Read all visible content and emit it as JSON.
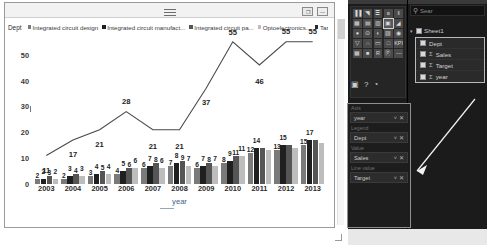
{
  "window": {
    "grip_icon": "window-grip",
    "restore_label": "❐",
    "minimize_label": "—"
  },
  "legend": {
    "title": "Dept",
    "items": [
      {
        "label": "Integrated circuit design",
        "color": "#7a7a7a"
      },
      {
        "label": "Integrated circuit manufact...",
        "color": "#1f1f1f"
      },
      {
        "label": "Integrated circuit pa...",
        "color": "#555555"
      },
      {
        "label": "Optoelectronics...",
        "color": "#bdbdbd"
      },
      {
        "label": "Target",
        "color": "#2b2b2b"
      }
    ]
  },
  "chart_data": {
    "type": "bar",
    "title": "",
    "xlabel": "year",
    "ylabel": "",
    "ylim": [
      0,
      55
    ],
    "yticks": [
      "0",
      "10",
      "20",
      "30",
      "40",
      "50"
    ],
    "grid": false,
    "legend_position": "top",
    "categories": [
      "2003",
      "2004",
      "2005",
      "2006",
      "2007",
      "2008",
      "2009",
      "2010",
      "2011",
      "2012",
      "2013"
    ],
    "series": [
      {
        "name": "Integrated circuit design",
        "type": "bar",
        "color": "#7a7a7a",
        "values": [
          2,
          2,
          3,
          4,
          6,
          7,
          6,
          8,
          12,
          13,
          15
        ],
        "labels": [
          "2",
          "2",
          "3",
          "4",
          "6",
          "7",
          "6",
          "8",
          "12",
          "13",
          "15"
        ]
      },
      {
        "name": "Integrated circuit manufact...",
        "type": "bar",
        "color": "#1f1f1f",
        "values": [
          2,
          3,
          4,
          5,
          7,
          8,
          7,
          9,
          14,
          15,
          17
        ],
        "labels": [
          "2",
          "3",
          "4",
          "5",
          "7",
          "8",
          "7",
          "9",
          "14",
          "15",
          "17"
        ]
      },
      {
        "name": "Integrated circuit pa...",
        "type": "bar",
        "color": "#555555",
        "values": [
          3,
          4,
          5,
          6,
          8,
          9,
          8,
          11,
          14,
          15,
          17
        ],
        "labels": [
          "3",
          "4",
          "5",
          "6",
          "8",
          "9",
          "8",
          "11",
          "",
          "",
          ""
        ]
      },
      {
        "name": "Optoelectronics...",
        "type": "bar",
        "color": "#bdbdbd",
        "values": [
          2,
          3,
          4,
          6,
          6,
          7,
          7,
          11,
          13,
          14,
          16
        ],
        "labels": [
          "2",
          "3",
          "4",
          "6",
          "6",
          "7",
          "7",
          "11",
          "",
          "",
          ""
        ]
      },
      {
        "name": "Target",
        "type": "line",
        "color": "#4a4a4a",
        "values": [
          11,
          17,
          21,
          28,
          21,
          21,
          37,
          55,
          46,
          55,
          55
        ],
        "labels": [
          "11",
          "17",
          "21",
          "28",
          "21",
          "21",
          "37",
          "55",
          "46",
          "55",
          "55"
        ]
      }
    ]
  },
  "bi_pane": {
    "visualization_gallery": {
      "name": "visualizations",
      "cells": [
        "▐▐",
        "◥",
        "≣",
        "≡",
        "‖",
        "▦",
        "▤",
        "▥",
        "▣",
        "◢",
        "●",
        "⊙",
        "◐",
        "▨",
        "◉",
        "▽",
        "∩",
        "▭",
        "□",
        "KPI",
        "▦",
        "■",
        "R",
        "Ⓟ",
        "⋯"
      ],
      "selected_index": 8,
      "extra_icons": [
        "▣",
        "?",
        "◔"
      ]
    },
    "search": {
      "icon": "search-icon",
      "placeholder": "Sear"
    },
    "data_source": {
      "expand_icon": "caret-down-icon",
      "label": "Sheet1",
      "fields": [
        {
          "label": "Dept",
          "aggregate": "",
          "checked": true
        },
        {
          "label": "Sales",
          "aggregate": "Σ",
          "checked": true
        },
        {
          "label": "Target",
          "aggregate": "Σ",
          "checked": true
        },
        {
          "label": "year",
          "aggregate": "Σ",
          "checked": true
        }
      ]
    },
    "wells": [
      {
        "section": "Axis",
        "chip": "year",
        "remove_icon": "close-icon"
      },
      {
        "section": "Legend",
        "chip": "Dept",
        "remove_icon": "close-icon"
      },
      {
        "section": "Value",
        "chip": "Sales",
        "remove_icon": "close-icon"
      },
      {
        "section": "Line value",
        "chip": "Target",
        "remove_icon": "close-icon"
      }
    ]
  }
}
